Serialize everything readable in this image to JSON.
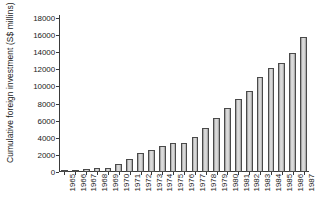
{
  "chart_data": {
    "type": "bar",
    "title": "",
    "subtitle": "",
    "xlabel": "",
    "ylabel": "Cumulative foreign investment (S$ millins)",
    "categories": [
      "1965",
      "1966",
      "1967",
      "1968",
      "1969",
      "1970",
      "1971",
      "1972",
      "1973",
      "1974",
      "1975",
      "1976",
      "1977",
      "1978",
      "1979",
      "1980",
      "1981",
      "1982",
      "1983",
      "1984",
      "1985",
      "1986",
      "1987"
    ],
    "values": [
      157,
      212,
      352,
      442,
      519,
      995,
      1570,
      2235,
      2570,
      3050,
      3365,
      3395,
      4080,
      5190,
      6350,
      7450,
      8480,
      9480,
      11100,
      12150,
      12700,
      13900,
      15800
    ],
    "series": [
      {
        "name": "Cumulative foreign investment",
        "values": [
          157,
          212,
          352,
          442,
          519,
          995,
          1570,
          2235,
          2570,
          3050,
          3365,
          3395,
          4080,
          5190,
          6350,
          7450,
          8480,
          9480,
          11100,
          12150,
          12700,
          13900,
          15800
        ]
      }
    ],
    "ylim": [
      0,
      18000
    ],
    "yticks": [
      0,
      2000,
      4000,
      6000,
      8000,
      10000,
      12000,
      14000,
      16000,
      18000
    ],
    "ytick_labels": [
      "0",
      "2000",
      "4000",
      "6000",
      "8000",
      "10000",
      "12000",
      "14000",
      "16000",
      "18000"
    ],
    "grid": false,
    "legend": null,
    "legend_position": "none",
    "bar_fill_color": "#d8d8d8",
    "bar_edge_color": "#4a4a4a",
    "axis_color": "#3a3a3a",
    "background_color": "#ffffff",
    "text_color": "#1a1a1a"
  }
}
